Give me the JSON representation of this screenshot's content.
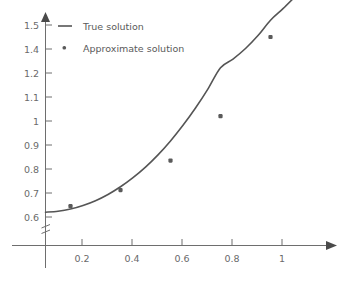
{
  "chart_data": {
    "type": "line",
    "title": "",
    "subtitle": "",
    "xlabel": "",
    "ylabel": "",
    "xlim": [
      0,
      1.18
    ],
    "ylim": [
      0.6,
      1.56
    ],
    "grid": false,
    "legend_position": "top-left",
    "y_axis_break": true,
    "x_ticks": [
      "0.2",
      "0.4",
      "0.6",
      "0.8",
      "1"
    ],
    "x_tick_values": [
      0.2,
      0.4,
      0.6,
      0.8,
      1
    ],
    "y_ticks": [
      "0.6",
      "0.7",
      "0.8",
      "0.9",
      "1",
      "1.1",
      "1.2",
      "1.4",
      "1.5"
    ],
    "y_tick_values": [
      0.6,
      0.7,
      0.8,
      0.9,
      1.0,
      1.1,
      1.2,
      1.3,
      1.4
    ],
    "series": [
      {
        "name": "True solution",
        "marker": "line",
        "color": "#555555",
        "x": [
          0.0,
          0.05,
          0.1,
          0.15,
          0.2,
          0.25,
          0.3,
          0.35,
          0.4,
          0.45,
          0.5,
          0.55,
          0.6,
          0.65,
          0.7,
          0.75,
          0.8,
          0.85,
          0.9,
          0.95,
          1.0
        ],
        "values": [
          0.62,
          0.624,
          0.633,
          0.648,
          0.668,
          0.694,
          0.726,
          0.764,
          0.808,
          0.859,
          0.917,
          0.982,
          1.054,
          1.134,
          1.222,
          1.258,
          1.302,
          1.356,
          1.42,
          1.468,
          1.52
        ]
      },
      {
        "name": "Approximate solution",
        "marker": "square-dot",
        "color": "#5a5a5a",
        "x": [
          0.1,
          0.3,
          0.5,
          0.7,
          0.9
        ],
        "values": [
          0.645,
          0.712,
          0.835,
          1.02,
          1.35
        ]
      }
    ],
    "legend": [
      {
        "label": "True solution",
        "marker": "line",
        "color": "#555555"
      },
      {
        "label": "Approximate solution",
        "marker": "dot",
        "color": "#5a5a5a"
      }
    ]
  },
  "colors": {
    "line": "#555555",
    "marker": "#5a5a5a",
    "axis": "#6e6e6e",
    "tick_text": "#6a6a6a",
    "legend_text": "#5a5a5a",
    "background": "#ffffff"
  }
}
